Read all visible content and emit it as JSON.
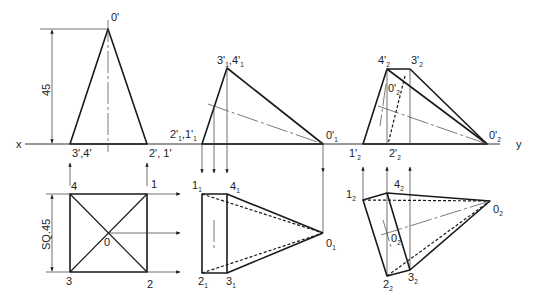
{
  "figure": {
    "reference_line": {
      "left_label": "x",
      "right_label": "y"
    },
    "dimensions": {
      "height_label": "45",
      "square_label": "SQ.45"
    },
    "stage1": {
      "front": {
        "apex": "0'",
        "base_left": "3',4'",
        "base_right": "2', 1'"
      },
      "top": {
        "corner_tl": "4",
        "corner_tr": "1",
        "corner_bl": "3",
        "corner_br": "2",
        "center": "0"
      }
    },
    "stage2": {
      "front": {
        "left_main": "2'",
        "left_sub1": "1",
        "left_sep": ",1'",
        "left_sub2": "1",
        "top_main": "3'",
        "top_sub1": "1",
        "top_sep": ",4'",
        "top_sub2": "1",
        "apex_main": "0'",
        "apex_sub": "1"
      },
      "top": {
        "p1_main": "1",
        "p1_sub": "1",
        "p4_main": "4",
        "p4_sub": "1",
        "p2_main": "2",
        "p2_sub": "1",
        "p3_main": "3",
        "p3_sub": "1",
        "apex_main": "0",
        "apex_sub": "1"
      }
    },
    "stage3": {
      "front": {
        "p4_main": "4'",
        "p4_sub": "2",
        "p3_main": "3'",
        "p3_sub": "2",
        "center_main": "0'",
        "center_sub": "2",
        "p1_main": "1'",
        "p1_sub": "2",
        "p2_main": "2'",
        "p2_sub": "2",
        "apex_main": "0'",
        "apex_sub": "2"
      },
      "top": {
        "p1_main": "1",
        "p1_sub": "2",
        "p4_main": "4",
        "p4_sub": "2",
        "center_main": "0",
        "center_sub": "2",
        "p2_main": "2",
        "p2_sub": "2",
        "p3_main": "3",
        "p3_sub": "2",
        "apex_main": "0",
        "apex_sub": "2"
      }
    }
  }
}
